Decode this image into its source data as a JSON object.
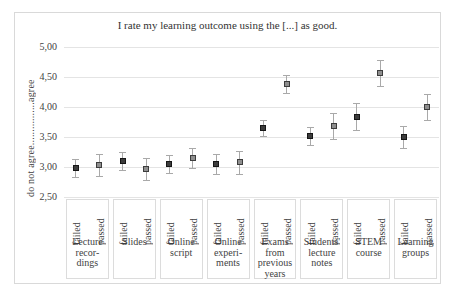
{
  "chart_data": {
    "type": "scatter",
    "title": "I rate my learning outcome using the [...] as good.",
    "ylabel": "do not agree................agree",
    "ylim": [
      2.5,
      5.0
    ],
    "ytick_labels": [
      "5,00",
      "4,50",
      "4,00",
      "3,50",
      "3,00",
      "2,50"
    ],
    "ytick_values": [
      5.0,
      4.5,
      4.0,
      3.5,
      3.0,
      2.5
    ],
    "grid": "horizontal-light",
    "legend": "none",
    "categories": [
      "Lecture recordings",
      "Slides",
      "Online script",
      "Online experiments",
      "Exams from previous years",
      "Students' lecture notes",
      "STEM course",
      "Learning groups"
    ],
    "category_label_lines": [
      [
        "Lecture",
        "recor-",
        "dings"
      ],
      [
        "Slides"
      ],
      [
        "Online",
        "script"
      ],
      [
        "Online",
        "experi-",
        "ments"
      ],
      [
        "Exams",
        "from",
        "previous",
        "years"
      ],
      [
        "Students'",
        "lecture",
        "notes"
      ],
      [
        "STEM",
        "course"
      ],
      [
        "Learning",
        "groups"
      ]
    ],
    "sub_labels": [
      "failed",
      "passed"
    ],
    "series": [
      {
        "name": "failed",
        "marker": "dark-square",
        "values": [
          2.98,
          3.1,
          3.05,
          3.05,
          3.65,
          3.52,
          3.84,
          3.5
        ],
        "errors": [
          0.15,
          0.15,
          0.15,
          0.16,
          0.13,
          0.15,
          0.22,
          0.19
        ]
      },
      {
        "name": "passed",
        "marker": "gray-square",
        "values": [
          3.03,
          2.97,
          3.15,
          3.08,
          4.38,
          3.68,
          4.57,
          4.0
        ],
        "errors": [
          0.18,
          0.18,
          0.17,
          0.19,
          0.15,
          0.22,
          0.22,
          0.21
        ]
      }
    ],
    "colors": {
      "marker_failed": "#3c3c3c",
      "marker_passed": "#8f8f8f",
      "error_bar": "#a9a9a9",
      "gridline": "#e4e4e4",
      "frame_border": "#d9d9d9",
      "text": "#3f3f3f"
    }
  }
}
